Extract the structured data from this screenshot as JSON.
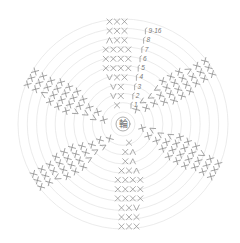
{
  "diagram": {
    "type": "crochet-round-chart",
    "center_symbol": "輪",
    "center_meaning": "magic ring",
    "rings": 11,
    "sectors": 6,
    "round_labels": [
      "1",
      "2",
      "3",
      "4",
      "5",
      "6",
      "7",
      "8",
      "9-16"
    ],
    "stitch_legend": {
      "X": "single crochet",
      "V": "increase (2 sc in same st)",
      "Λ": "decrease"
    },
    "colors": {
      "ring": "#e6e6e6",
      "stitch": "#8a8a8a",
      "label": "#777777"
    },
    "sector_rows": [
      {
        "round": "1",
        "stitches": "X"
      },
      {
        "round": "2",
        "stitches": "VX"
      },
      {
        "round": "3",
        "stitches": "VX"
      },
      {
        "round": "4",
        "stitches": "VXX"
      },
      {
        "round": "5",
        "stitches": "XXXX"
      },
      {
        "round": "6",
        "stitches": "XXXX"
      },
      {
        "round": "7",
        "stitches": "XXXX"
      },
      {
        "round": "8",
        "stitches": "ΛXX"
      },
      {
        "round": "9-16",
        "stitches": "XXX"
      }
    ]
  }
}
